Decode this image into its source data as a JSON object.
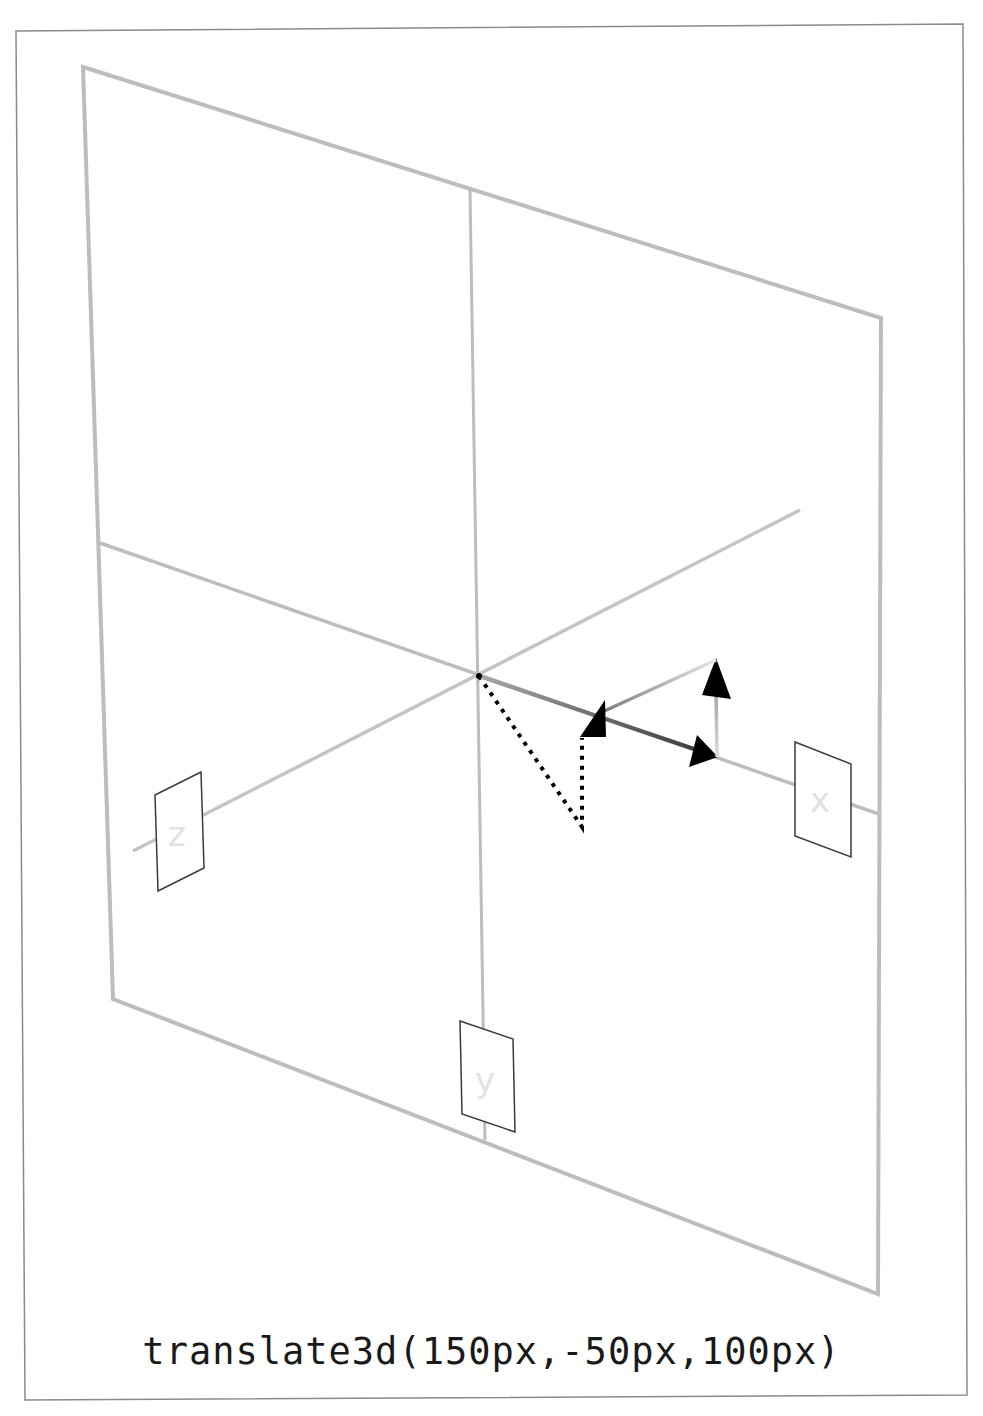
{
  "caption": "translate3d(150px,-50px,100px)",
  "transform": {
    "function": "translate3d",
    "x": "150px",
    "y": "-50px",
    "z": "100px"
  },
  "axes": {
    "x_label": "x",
    "y_label": "y",
    "z_label": "z"
  },
  "colors": {
    "frame": "#8a8a8a",
    "plane": "#bdbdbd",
    "axis": "#b8b8b8",
    "arrow": "#000000",
    "label_box": "#3a3a3a",
    "label_text": "#e2e2e2",
    "caption": "#1a1a1a"
  }
}
